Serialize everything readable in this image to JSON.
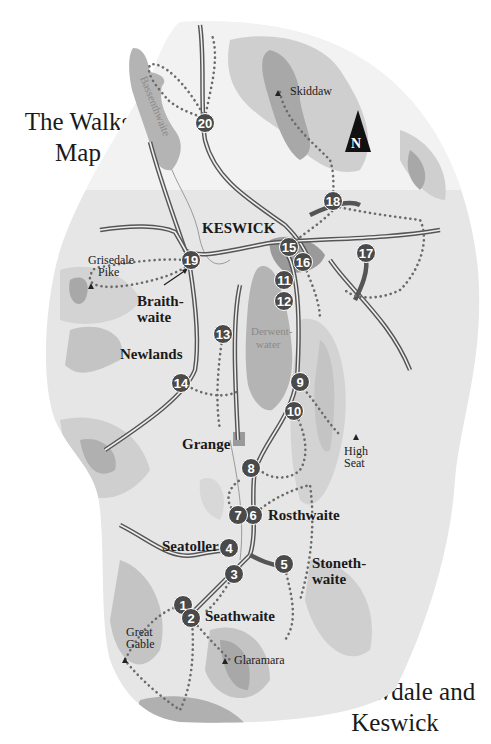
{
  "titles": {
    "top": [
      "The Walks",
      "Map"
    ],
    "bottom": [
      "Borrowdale and",
      "Keswick"
    ]
  },
  "north_arrow": {
    "label": "N"
  },
  "lakes": {
    "bassenthwaite": "Bassenthwaite",
    "derwentwater": [
      "Derwent-",
      "water"
    ]
  },
  "places": {
    "keswick": "KESWICK",
    "braithwaite": [
      "Braith-",
      "waite"
    ],
    "newlands": "Newlands",
    "grange": "Grange",
    "rosthwaite": "Rosthwaite",
    "seatoller": "Seatoller",
    "stonethwaite": [
      "Stoneth-",
      "waite"
    ],
    "seathwaite": "Seathwaite"
  },
  "peaks": {
    "skiddaw": "Skiddaw",
    "grisedale_pike": [
      "Grisedale",
      "Pike"
    ],
    "high_seat": [
      "High",
      "Seat"
    ],
    "great_gable": [
      "Great",
      "Gable"
    ],
    "glaramara": "Glaramara"
  },
  "walk_markers": [
    {
      "n": "1",
      "x": 183,
      "y": 605
    },
    {
      "n": "2",
      "x": 191,
      "y": 618
    },
    {
      "n": "3",
      "x": 234,
      "y": 574
    },
    {
      "n": "4",
      "x": 229,
      "y": 548
    },
    {
      "n": "5",
      "x": 284,
      "y": 564
    },
    {
      "n": "6",
      "x": 253,
      "y": 515
    },
    {
      "n": "7",
      "x": 238,
      "y": 515
    },
    {
      "n": "8",
      "x": 251,
      "y": 468
    },
    {
      "n": "9",
      "x": 300,
      "y": 382
    },
    {
      "n": "10",
      "x": 294,
      "y": 411
    },
    {
      "n": "11",
      "x": 284,
      "y": 280
    },
    {
      "n": "12",
      "x": 284,
      "y": 301
    },
    {
      "n": "13",
      "x": 223,
      "y": 334
    },
    {
      "n": "14",
      "x": 181,
      "y": 383
    },
    {
      "n": "15",
      "x": 289,
      "y": 247
    },
    {
      "n": "16",
      "x": 303,
      "y": 262
    },
    {
      "n": "17",
      "x": 366,
      "y": 253
    },
    {
      "n": "18",
      "x": 333,
      "y": 201
    },
    {
      "n": "19",
      "x": 191,
      "y": 260
    },
    {
      "n": "20",
      "x": 205,
      "y": 123
    }
  ],
  "colors": {
    "land_light": "#e6e6e6",
    "land_mid": "#cfcfcf",
    "land_dark": "#a8a8a8",
    "lake": "#b4b4b4",
    "marker": "#4a4a4a",
    "road": "#555555"
  }
}
